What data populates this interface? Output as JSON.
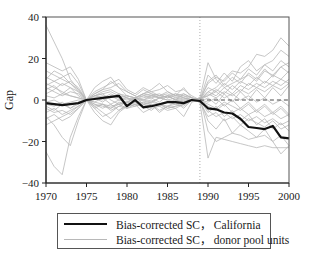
{
  "chart_data": {
    "type": "line",
    "title": "",
    "xlabel": "",
    "ylabel": "Gap",
    "xlim": [
      1970,
      2000
    ],
    "ylim": [
      -40,
      40
    ],
    "x_ticks": [
      1970,
      1975,
      1980,
      1985,
      1990,
      1995,
      2000
    ],
    "y_ticks": [
      40,
      20,
      0,
      -20,
      -40
    ],
    "y_tick_labels": [
      "40",
      "20",
      "0",
      "−20",
      "−40"
    ],
    "treatment_year": 1989,
    "reference_line": {
      "y": 0,
      "style": "dashed"
    },
    "grid": false,
    "legend_position": "below",
    "x": [
      1970,
      1971,
      1972,
      1973,
      1974,
      1975,
      1976,
      1977,
      1978,
      1979,
      1980,
      1981,
      1982,
      1983,
      1984,
      1985,
      1986,
      1987,
      1988,
      1989,
      1990,
      1991,
      1992,
      1993,
      1994,
      1995,
      1996,
      1997,
      1998,
      1999,
      2000
    ],
    "series": [
      {
        "name": "Bias-corrected SC， California",
        "style": "thick-black",
        "values": [
          -1.5,
          -2,
          -2.5,
          -2,
          -1.5,
          0,
          0.5,
          1,
          1.5,
          2,
          -3,
          0,
          -3.5,
          -3,
          -2,
          -1,
          -1,
          -1.5,
          0,
          -0.5,
          -4,
          -4.5,
          -6,
          -6.5,
          -9,
          -13,
          -13.5,
          -14,
          -12.5,
          -18,
          -18.5
        ]
      },
      {
        "name": "Bias-corrected SC， donor pool units",
        "style": "thin-gray",
        "note": "approx. 38 placebo lines; values estimated",
        "lines": [
          [
            36,
            28,
            20,
            10,
            5,
            0,
            3,
            5,
            6,
            8,
            4,
            2,
            -2,
            -1,
            1,
            2,
            0,
            3,
            1,
            0,
            4,
            6,
            10,
            14,
            13,
            16,
            22,
            21,
            24,
            30,
            26
          ],
          [
            -25,
            -32,
            -36,
            -18,
            -8,
            0,
            2,
            3,
            0,
            -2,
            -4,
            -3,
            -2,
            -1,
            -2,
            -3,
            -2,
            -1,
            0,
            -1,
            -28,
            -18,
            -19,
            -20,
            -21,
            -22,
            -23,
            -22,
            -23,
            -23,
            -23
          ],
          [
            18,
            16,
            14,
            16,
            10,
            0,
            -4,
            -8,
            -6,
            -3,
            -1,
            1,
            3,
            2,
            1,
            2,
            0,
            -1,
            0,
            1,
            -15,
            -20,
            -18,
            -16,
            -17,
            -19,
            -18,
            -17,
            -20,
            -26,
            -22
          ],
          [
            10,
            14,
            12,
            8,
            4,
            0,
            6,
            9,
            11,
            6,
            4,
            2,
            5,
            3,
            2,
            4,
            2,
            6,
            1,
            0,
            12,
            8,
            13,
            9,
            16,
            19,
            14,
            17,
            19,
            24,
            21
          ],
          [
            -8,
            -12,
            -18,
            -22,
            -10,
            0,
            -6,
            -10,
            -12,
            -6,
            -3,
            -2,
            -6,
            -4,
            -3,
            -5,
            -4,
            -8,
            -1,
            0,
            -10,
            -14,
            -9,
            -16,
            -12,
            -15,
            -18,
            -14,
            -20,
            -17,
            -22
          ],
          [
            6,
            4,
            2,
            4,
            3,
            0,
            2,
            3,
            4,
            2,
            1,
            0,
            2,
            1,
            2,
            3,
            1,
            2,
            0,
            1,
            18,
            10,
            6,
            8,
            10,
            12,
            9,
            14,
            12,
            16,
            18
          ],
          [
            -4,
            -6,
            -5,
            -7,
            -4,
            0,
            -3,
            -2,
            -4,
            -1,
            -2,
            -3,
            -1,
            -2,
            -3,
            -1,
            -2,
            -3,
            0,
            -1,
            -8,
            -6,
            -10,
            -8,
            -12,
            -9,
            -11,
            -13,
            -10,
            -14,
            -12
          ],
          [
            3,
            5,
            8,
            6,
            4,
            0,
            1,
            2,
            1,
            3,
            2,
            1,
            3,
            4,
            2,
            1,
            3,
            2,
            1,
            0,
            6,
            4,
            8,
            5,
            9,
            7,
            11,
            8,
            12,
            10,
            14
          ],
          [
            -2,
            -3,
            -1,
            -4,
            -2,
            0,
            -1,
            -2,
            -3,
            -2,
            -1,
            -2,
            -1,
            0,
            -2,
            -1,
            0,
            -1,
            0,
            0,
            -3,
            -5,
            -2,
            -6,
            -4,
            -7,
            -5,
            -8,
            -6,
            -9,
            -7
          ],
          [
            8,
            6,
            4,
            2,
            1,
            0,
            -2,
            -3,
            -4,
            -2,
            -1,
            0,
            -2,
            -3,
            -2,
            -4,
            -3,
            -2,
            0,
            1,
            2,
            5,
            3,
            7,
            4,
            8,
            6,
            9,
            7,
            10,
            8
          ],
          [
            -12,
            -10,
            -8,
            -6,
            -3,
            0,
            2,
            4,
            5,
            3,
            1,
            0,
            1,
            2,
            3,
            1,
            2,
            3,
            1,
            0,
            -2,
            -4,
            -1,
            -3,
            -5,
            -2,
            -6,
            -3,
            -7,
            -4,
            -8
          ],
          [
            14,
            12,
            10,
            8,
            5,
            0,
            4,
            6,
            8,
            10,
            5,
            3,
            6,
            4,
            5,
            7,
            4,
            5,
            2,
            0,
            9,
            12,
            7,
            11,
            8,
            13,
            10,
            15,
            11,
            16,
            13
          ],
          [
            -6,
            -4,
            -7,
            -5,
            -3,
            0,
            -2,
            -4,
            -2,
            -5,
            -3,
            -1,
            -4,
            -2,
            -5,
            -3,
            -4,
            -2,
            0,
            -1,
            1,
            -2,
            3,
            -1,
            4,
            0,
            5,
            1,
            6,
            2,
            7
          ],
          [
            2,
            1,
            3,
            2,
            1,
            0,
            1,
            0,
            2,
            1,
            0,
            1,
            0,
            2,
            1,
            0,
            1,
            0,
            0,
            0,
            4,
            2,
            6,
            3,
            7,
            5,
            8,
            6,
            9,
            7,
            10
          ],
          [
            -1,
            0,
            -2,
            -1,
            0,
            0,
            3,
            5,
            9,
            6,
            2,
            1,
            3,
            5,
            8,
            4,
            2,
            1,
            0,
            0,
            -6,
            -3,
            -8,
            -5,
            -10,
            -7,
            -12,
            -9,
            -14,
            -11,
            -15
          ],
          [
            5,
            7,
            3,
            6,
            2,
            0,
            -3,
            -6,
            -9,
            -5,
            -2,
            -1,
            -3,
            -2,
            -6,
            -3,
            -1,
            -4,
            0,
            0,
            3,
            1,
            4,
            2,
            5,
            3,
            6,
            4,
            7,
            5,
            8
          ],
          [
            -9,
            -7,
            -10,
            -8,
            -4,
            0,
            1,
            -1,
            2,
            0,
            1,
            -1,
            0,
            1,
            -1,
            2,
            0,
            1,
            0,
            0,
            2,
            4,
            1,
            3,
            0,
            2,
            -1,
            1,
            -2,
            0,
            -3
          ],
          [
            11,
            9,
            7,
            9,
            6,
            0,
            -1,
            1,
            -2,
            0,
            -1,
            1,
            0,
            -1,
            1,
            0,
            -1,
            0,
            0,
            0,
            -1,
            1,
            -3,
            0,
            -4,
            -1,
            -5,
            -2,
            -6,
            -3,
            -7
          ],
          [
            -3,
            -5,
            -2,
            -4,
            -1,
            0,
            2,
            1,
            3,
            1,
            2,
            1,
            2,
            3,
            1,
            2,
            3,
            1,
            0,
            0,
            8,
            11,
            9,
            13,
            10,
            15,
            12,
            17,
            14,
            19,
            16
          ],
          [
            7,
            9,
            11,
            13,
            8,
            0,
            -4,
            -2,
            -5,
            -3,
            -4,
            -2,
            -3,
            -5,
            -2,
            -4,
            -3,
            -2,
            0,
            0,
            -5,
            -8,
            -6,
            -9,
            -7,
            -10,
            -8,
            -11,
            -9,
            -12,
            -10
          ]
        ]
      }
    ]
  },
  "legend": {
    "items": [
      {
        "label": "Bias-corrected SC， California",
        "style": "thick-black"
      },
      {
        "label": "Bias-corrected SC， donor pool units",
        "style": "thin-gray"
      }
    ]
  },
  "colors": {
    "california": "#111111",
    "donor": "#b8b8b8",
    "axis": "#222222",
    "frame": "#555555"
  }
}
